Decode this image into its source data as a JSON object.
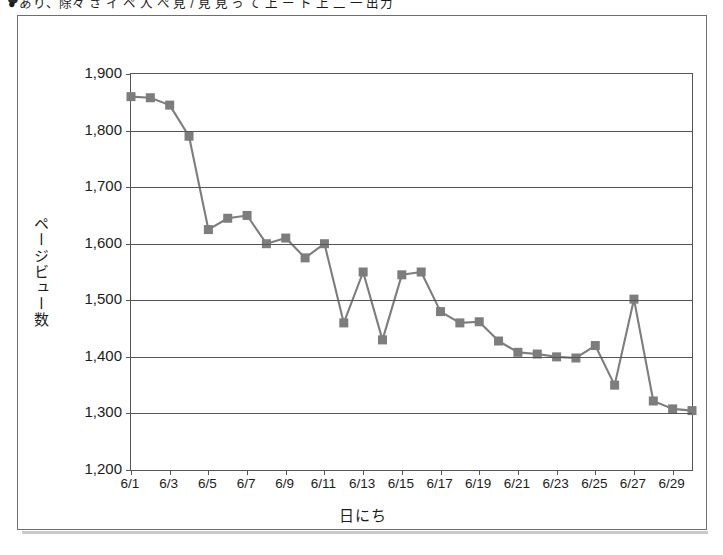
{
  "caption": {
    "bullet": "bullet-icon",
    "text": "● あり、除々 さ イ ペ 人 ぺ 見 / 見 見 っ て 上 ー ト 上 二 一 出力"
  },
  "chart_data": {
    "type": "line",
    "title": "",
    "xlabel": "日にち",
    "ylabel": "ページビュー数",
    "ylim": [
      1200,
      1900
    ],
    "ytick_step": 100,
    "yticks": [
      "1,200",
      "1,300",
      "1,400",
      "1,500",
      "1,600",
      "1,700",
      "1,800",
      "1,900"
    ],
    "grid": true,
    "legend": "none",
    "marker": "square",
    "marker_color": "#7d7d7d",
    "line_color": "#7d7d7d",
    "x": [
      "6/1",
      "6/2",
      "6/3",
      "6/4",
      "6/5",
      "6/6",
      "6/7",
      "6/8",
      "6/9",
      "6/10",
      "6/11",
      "6/12",
      "6/13",
      "6/14",
      "6/15",
      "6/16",
      "6/17",
      "6/18",
      "6/19",
      "6/20",
      "6/21",
      "6/22",
      "6/23",
      "6/24",
      "6/25",
      "6/26",
      "6/27",
      "6/28",
      "6/29",
      "6/30"
    ],
    "xtick_labels": [
      "6/1",
      "6/3",
      "6/5",
      "6/7",
      "6/9",
      "6/11",
      "6/13",
      "6/15",
      "6/17",
      "6/19",
      "6/21",
      "6/23",
      "6/25",
      "6/27",
      "6/29"
    ],
    "values": [
      1860,
      1858,
      1845,
      1790,
      1625,
      1645,
      1650,
      1600,
      1610,
      1575,
      1600,
      1460,
      1550,
      1430,
      1545,
      1550,
      1480,
      1460,
      1462,
      1428,
      1408,
      1405,
      1400,
      1398,
      1420,
      1350,
      1502,
      1322,
      1308,
      1305
    ]
  }
}
